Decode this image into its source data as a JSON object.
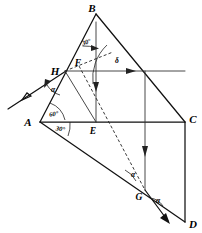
{
  "figure": {
    "background_color": "#ffffff",
    "line_color": "#111111",
    "width": 202,
    "height": 233
  },
  "vertices": [
    {
      "id": "B",
      "label": "B",
      "x": 96,
      "y": 14,
      "label_x": 93,
      "label_y": 11
    },
    {
      "id": "H",
      "label": "H",
      "x": 65,
      "y": 71,
      "label_x": 55,
      "label_y": 73
    },
    {
      "id": "F",
      "label": "F",
      "x": 84,
      "y": 62,
      "label_x": 78,
      "label_y": 63
    },
    {
      "id": "A",
      "label": "A",
      "x": 40,
      "y": 122,
      "label_x": 28,
      "label_y": 126
    },
    {
      "id": "E",
      "label": "E",
      "x": 96,
      "y": 122,
      "label_x": 92,
      "label_y": 133
    },
    {
      "id": "C",
      "label": "C",
      "x": 185,
      "y": 122,
      "label_x": 189,
      "label_y": 122
    },
    {
      "id": "G",
      "label": "G",
      "x": 145,
      "y": 190,
      "label_x": 138,
      "label_y": 198
    },
    {
      "id": "D",
      "label": "D",
      "x": 185,
      "y": 222,
      "label_x": 190,
      "label_y": 226
    }
  ],
  "angles": [
    {
      "id": "angle-B",
      "label": "30°",
      "x": 90,
      "y": 42,
      "rotate": -18
    },
    {
      "id": "angle-A-upper",
      "label": "60°",
      "x": 52,
      "y": 114,
      "rotate": -8
    },
    {
      "id": "angle-A-lower",
      "label": "30°",
      "x": 58,
      "y": 129,
      "rotate": 10
    },
    {
      "id": "angle-H",
      "label": "α",
      "x": 52,
      "y": 90,
      "rotate": 0
    },
    {
      "id": "angle-delta",
      "label": "δ",
      "x": 117,
      "y": 61,
      "rotate": 0
    },
    {
      "id": "angle-G-upper",
      "label": "α",
      "x": 134,
      "y": 175,
      "rotate": 0
    },
    {
      "id": "angle-G-lower",
      "label": "α",
      "x": 158,
      "y": 201,
      "rotate": 0
    }
  ],
  "segments": [
    {
      "id": "seg-AB",
      "from": "A",
      "to": "B",
      "style": "solid"
    },
    {
      "id": "seg-BC",
      "from": "B",
      "to": "C",
      "style": "solid"
    },
    {
      "id": "seg-AC",
      "from": "A",
      "to": "C",
      "style": "solid"
    },
    {
      "id": "seg-AD",
      "from": "A",
      "to": "D",
      "style": "solid"
    },
    {
      "id": "seg-CD",
      "from": "C",
      "to": "D",
      "style": "solid"
    },
    {
      "id": "seg-BE",
      "from": "B",
      "to": "E",
      "style": "thin-arrow"
    },
    {
      "id": "seg-H-horizontal",
      "from": "H",
      "to": "right",
      "style": "thin-arrow"
    },
    {
      "id": "seg-vertical-drop",
      "from": "top",
      "to": "bottom",
      "style": "thin-arrow"
    },
    {
      "id": "seg-FG-dashed",
      "from": "F",
      "to": "G",
      "style": "dashed"
    },
    {
      "id": "seg-HF-dashed",
      "from": "H",
      "to": "F",
      "style": "dashed"
    }
  ],
  "rays": [
    {
      "id": "incident-ray",
      "description": "incoming ray arriving at H from lower-left",
      "direction": "down-left arrowhead"
    },
    {
      "id": "exit-ray-G",
      "description": "outgoing ray leaving G toward lower-left",
      "direction": "down-left arrowhead"
    },
    {
      "id": "normal-ray-H",
      "description": "horizontal normal at H pointing right",
      "direction": "right arrowhead"
    },
    {
      "id": "normal-ray-B",
      "description": "vertical line B to E pointing down",
      "direction": "down arrowhead"
    },
    {
      "id": "normal-ray-drop",
      "description": "vertical line pointing down past C level",
      "direction": "down arrowhead"
    }
  ]
}
